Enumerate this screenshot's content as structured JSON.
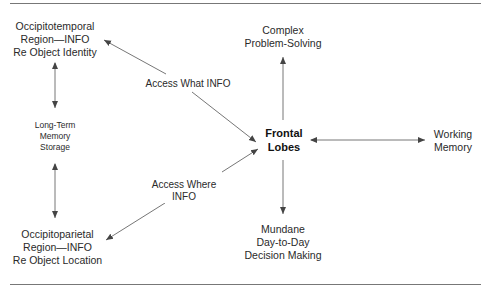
{
  "diagram": {
    "nodes": {
      "occipitotemporal": [
        "Occipitotemporal",
        "Region—INFO",
        "Re Object Identity"
      ],
      "long_term_memory": [
        "Long-Term",
        "Memory",
        "Storage"
      ],
      "occipitoparietal": [
        "Occipitoparietal",
        "Region—INFO",
        "Re Object Location"
      ],
      "frontal_lobes": [
        "Frontal",
        "Lobes"
      ],
      "complex_problem_solving": [
        "Complex",
        "Problem-Solving"
      ],
      "working_memory": [
        "Working",
        "Memory"
      ],
      "mundane_decision_making": [
        "Mundane",
        "Day-to-Day",
        "Decision Making"
      ]
    },
    "edge_labels": {
      "access_what": "Access What INFO",
      "access_where": [
        "Access Where",
        "INFO"
      ]
    },
    "edges": [
      {
        "from": "frontal_lobes",
        "to": "occipitotemporal",
        "label": "Access What INFO",
        "direction": "both"
      },
      {
        "from": "frontal_lobes",
        "to": "occipitoparietal",
        "label": "Access Where INFO",
        "direction": "both"
      },
      {
        "from": "occipitotemporal",
        "to": "long_term_memory",
        "direction": "both"
      },
      {
        "from": "long_term_memory",
        "to": "occipitoparietal",
        "direction": "both"
      },
      {
        "from": "frontal_lobes",
        "to": "complex_problem_solving",
        "direction": "forward"
      },
      {
        "from": "frontal_lobes",
        "to": "mundane_decision_making",
        "direction": "forward"
      },
      {
        "from": "frontal_lobes",
        "to": "working_memory",
        "direction": "both"
      }
    ],
    "colors": {
      "line": "#555555",
      "text": "#222222",
      "rule": "#777777"
    }
  }
}
